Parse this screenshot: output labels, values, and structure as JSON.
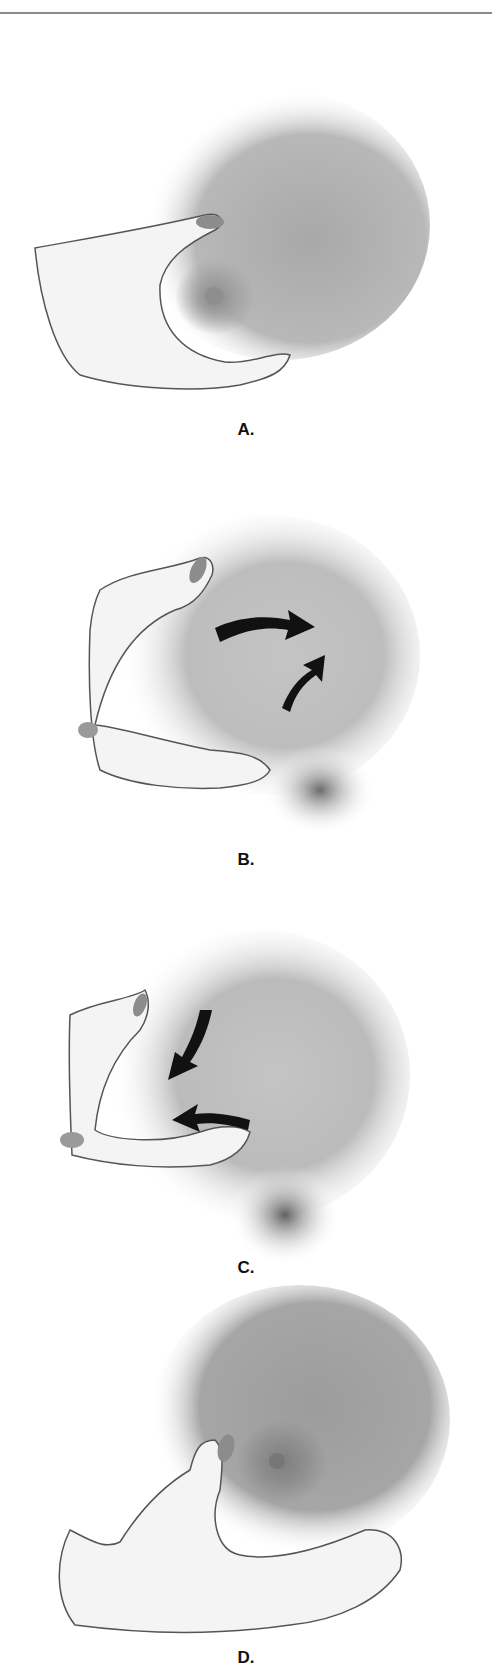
{
  "figure": {
    "panels": [
      {
        "id": "A",
        "label": "A.",
        "description": "Hand cupping breast from below with thumb on top",
        "arrows": 0
      },
      {
        "id": "B",
        "label": "B.",
        "description": "Breast compressed and pushed back toward chest wall",
        "arrows": 2,
        "arrow_direction": "outward-back"
      },
      {
        "id": "C",
        "label": "C.",
        "description": "Breast rolled forward toward nipple",
        "arrows": 2,
        "arrow_direction": "inward-forward"
      },
      {
        "id": "D",
        "label": "D.",
        "description": "Hand repositioned around breast",
        "arrows": 0
      }
    ],
    "colors": {
      "background": "#ffffff",
      "skin_shade": "#9a9a9a",
      "hand_fill": "#f4f4f4",
      "outline": "#555555",
      "nail": "#8c8c8c",
      "arrow": "#111111",
      "rule": "#8a8a8a"
    }
  }
}
